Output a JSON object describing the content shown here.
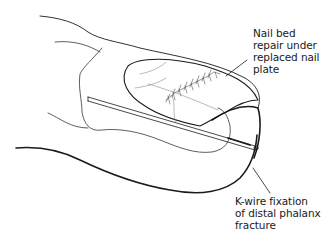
{
  "diagram": {
    "labels": [
      {
        "id": "nail-bed",
        "lines": [
          "Nail bed",
          "repair under",
          "replaced nail",
          "plate"
        ]
      },
      {
        "id": "k-wire",
        "lines": [
          "K-wire fixation",
          "of distal phalanx",
          "fracture"
        ]
      }
    ],
    "colors": {
      "line": "#1a1a1a",
      "faint_line": "#8a8a8a",
      "background": "#ffffff"
    }
  }
}
